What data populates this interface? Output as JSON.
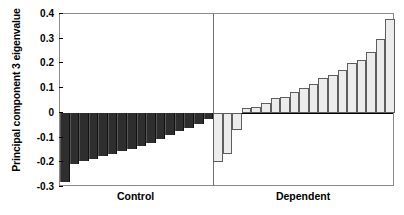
{
  "chart_data": {
    "type": "bar",
    "title": "",
    "xlabel": "",
    "ylabel": "Principal component 3 eigenvalue",
    "ylim": [
      -0.3,
      0.4
    ],
    "yticks": [
      0.4,
      0.3,
      0.2,
      0.1,
      0,
      -0.1,
      -0.2,
      -0.3
    ],
    "ytick_labels": [
      "0.4",
      "0.3",
      "0.2",
      "0.1",
      "0",
      "-0.1",
      "-0.2",
      "-0.3"
    ],
    "grid": false,
    "legend": "none",
    "group_labels": [
      "Control",
      "Dependent"
    ],
    "series": [
      {
        "name": "Control",
        "color": "#2e2e2e",
        "values": [
          -0.28,
          -0.205,
          -0.195,
          -0.185,
          -0.175,
          -0.165,
          -0.155,
          -0.145,
          -0.135,
          -0.12,
          -0.105,
          -0.09,
          -0.075,
          -0.06,
          -0.045,
          -0.025
        ]
      },
      {
        "name": "Dependent",
        "color": "#ececec",
        "values": [
          -0.2,
          -0.165,
          -0.07,
          0.02,
          0.025,
          0.04,
          0.06,
          0.065,
          0.085,
          0.1,
          0.115,
          0.14,
          0.155,
          0.175,
          0.2,
          0.215,
          0.245,
          0.3,
          0.38
        ]
      }
    ]
  },
  "axis": {
    "group_label_control": "Control",
    "group_label_dependent": "Dependent"
  }
}
